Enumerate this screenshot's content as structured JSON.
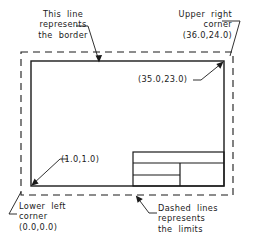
{
  "diagram": {
    "stroke_color": "#1a1a1a",
    "background_color": "#ffffff",
    "annotations": {
      "border_note": "This  line\nrepresents\nthe  border",
      "upper_right_note": "Upper  right\ncorner\n(36.0,24.0)",
      "inner_upper_right_coord": "(35.0,23.0)",
      "inner_lower_left_coord": "(1.0,1.0)",
      "lower_left_note": "Lower  left\ncorner\n(0.0,0.0)",
      "dashed_note": "Dashed  lines\nrepresents\nthe  limits"
    },
    "points": {
      "limits_lower_left": "(0.0,0.0)",
      "limits_upper_right": "(36.0,24.0)",
      "border_lower_left": "(1.0,1.0)",
      "border_upper_right": "(35.0,23.0)"
    },
    "elements": {
      "limits_rectangle_style": "dashed",
      "border_rectangle_style": "solid",
      "title_block_style": "solid"
    }
  }
}
